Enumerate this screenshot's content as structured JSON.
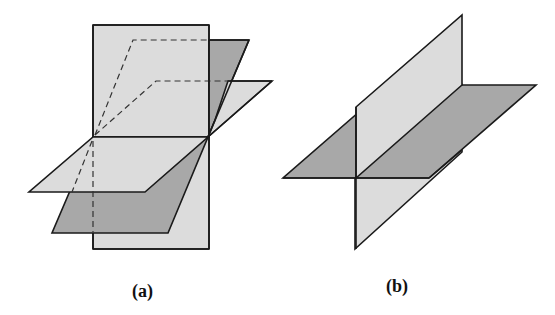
{
  "figure": {
    "panels": [
      {
        "id": "a",
        "label": "(a)",
        "description": "Three planes intersecting in a common line"
      },
      {
        "id": "b",
        "label": "(b)",
        "description": "Two perpendicular planes intersecting in a line"
      }
    ],
    "colors": {
      "light_plane": "#dcdcdc",
      "dark_plane": "#a8a8a8",
      "outline": "#1a1a1a"
    }
  }
}
